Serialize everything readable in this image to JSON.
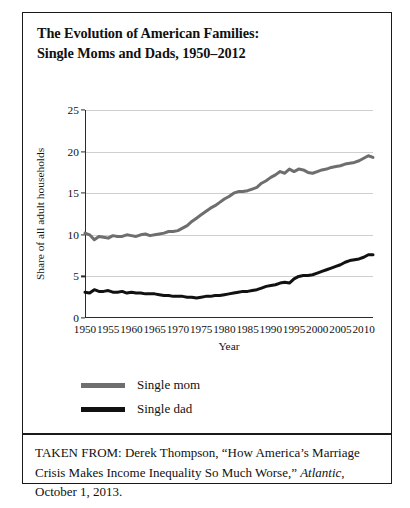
{
  "figure": {
    "title_line_1": "The Evolution of American Families:",
    "title_line_2": "Single Moms and Dads, 1950–2012",
    "source_prefix": "TAKEN FROM: Derek Thompson, “How America’s Marriage Crisis Makes Income Inequality So Much Worse,” ",
    "source_publication": "Atlantic",
    "source_suffix": ", October 1, 2013."
  },
  "legend": {
    "items": [
      {
        "label": "Single mom",
        "color": "#6e6e6e"
      },
      {
        "label": "Single dad",
        "color": "#111111"
      }
    ]
  },
  "chart_data": {
    "type": "line",
    "title": "The Evolution of American Families: Single Moms and Dads, 1950–2012",
    "xlabel": "Year",
    "ylabel": "Share of all adult households",
    "xlim": [
      1950,
      2012
    ],
    "ylim": [
      0,
      25
    ],
    "yticks": [
      0,
      5,
      10,
      15,
      20,
      25
    ],
    "xticks": [
      1950,
      1955,
      1960,
      1965,
      1970,
      1975,
      1980,
      1985,
      1990,
      1995,
      2000,
      2005,
      2010
    ],
    "grid": "horizontal",
    "legend_position": "below-left",
    "x": [
      1950,
      1951,
      1952,
      1953,
      1954,
      1955,
      1956,
      1957,
      1958,
      1959,
      1960,
      1961,
      1962,
      1963,
      1964,
      1965,
      1966,
      1967,
      1968,
      1969,
      1970,
      1971,
      1972,
      1973,
      1974,
      1975,
      1976,
      1977,
      1978,
      1979,
      1980,
      1981,
      1982,
      1983,
      1984,
      1985,
      1986,
      1987,
      1988,
      1989,
      1990,
      1991,
      1992,
      1993,
      1994,
      1995,
      1996,
      1997,
      1998,
      1999,
      2000,
      2001,
      2002,
      2003,
      2004,
      2005,
      2006,
      2007,
      2008,
      2009,
      2010,
      2011,
      2012
    ],
    "series": [
      {
        "name": "Single mom",
        "color": "#6e6e6e",
        "values": [
          10.2,
          10.0,
          9.4,
          9.8,
          9.7,
          9.6,
          9.9,
          9.8,
          9.8,
          10.0,
          9.9,
          9.8,
          10.0,
          10.1,
          9.9,
          10.0,
          10.1,
          10.2,
          10.4,
          10.4,
          10.5,
          10.8,
          11.1,
          11.6,
          12.0,
          12.4,
          12.8,
          13.2,
          13.5,
          13.9,
          14.3,
          14.6,
          15.0,
          15.2,
          15.2,
          15.3,
          15.5,
          15.7,
          16.2,
          16.5,
          16.9,
          17.2,
          17.6,
          17.4,
          17.9,
          17.6,
          17.9,
          17.8,
          17.5,
          17.4,
          17.6,
          17.8,
          17.9,
          18.1,
          18.2,
          18.3,
          18.5,
          18.6,
          18.7,
          18.9,
          19.2,
          19.5,
          19.3
        ]
      },
      {
        "name": "Single dad",
        "color": "#111111",
        "values": [
          3.1,
          3.0,
          3.4,
          3.2,
          3.2,
          3.3,
          3.1,
          3.1,
          3.2,
          3.0,
          3.1,
          3.0,
          3.0,
          2.9,
          2.9,
          2.9,
          2.8,
          2.7,
          2.7,
          2.6,
          2.6,
          2.6,
          2.5,
          2.5,
          2.4,
          2.5,
          2.6,
          2.6,
          2.7,
          2.7,
          2.8,
          2.9,
          3.0,
          3.1,
          3.2,
          3.2,
          3.3,
          3.4,
          3.6,
          3.8,
          3.9,
          4.0,
          4.2,
          4.3,
          4.2,
          4.7,
          5.0,
          5.1,
          5.1,
          5.2,
          5.4,
          5.6,
          5.8,
          6.0,
          6.2,
          6.4,
          6.7,
          6.9,
          7.0,
          7.1,
          7.3,
          7.6,
          7.6
        ]
      }
    ]
  }
}
